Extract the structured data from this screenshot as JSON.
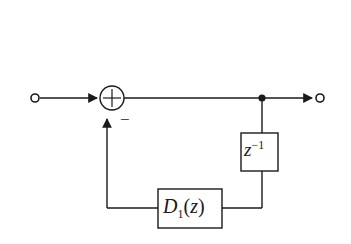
{
  "figure": {
    "type": "block-diagram",
    "background_color": "#ffffff",
    "line_color": "#1a1a1a",
    "canvas": {
      "width": 351,
      "height": 244
    }
  },
  "labels": {
    "delay_base": "z",
    "delay_exponent": "−1",
    "filter_base": "D",
    "filter_subscript": "1",
    "filter_open_paren": "(",
    "filter_arg": "z",
    "filter_close_paren": ")",
    "sum_minus_sign": "−",
    "sum_plus_sign": "+"
  },
  "nodes": [
    {
      "name": "input-terminal",
      "kind": "open-circle",
      "x": 35,
      "y": 98,
      "radius": 4
    },
    {
      "name": "summing-junction",
      "kind": "circle-plus",
      "x": 112,
      "y": 98,
      "radius": 12,
      "signs": [
        "+",
        "−"
      ]
    },
    {
      "name": "branch-node",
      "kind": "filled-dot",
      "x": 262,
      "y": 98,
      "radius": 4
    },
    {
      "name": "output-terminal",
      "kind": "open-circle",
      "x": 320,
      "y": 98,
      "radius": 4
    }
  ],
  "blocks": [
    {
      "name": "delay-block",
      "label": "z^-1",
      "x": 241,
      "y": 133,
      "width": 37,
      "height": 38
    },
    {
      "name": "filter-block",
      "label": "D_1(z)",
      "x": 158,
      "y": 189,
      "width": 64,
      "height": 39
    }
  ],
  "edges": [
    {
      "name": "input-to-sum",
      "from": "input-terminal",
      "to": "summing-junction",
      "arrow": true
    },
    {
      "name": "sum-to-branch",
      "from": "summing-junction",
      "to": "branch-node",
      "arrow": false
    },
    {
      "name": "branch-to-output",
      "from": "branch-node",
      "to": "output-terminal",
      "arrow": true
    },
    {
      "name": "branch-to-delay",
      "from": "branch-node",
      "to": "delay-block",
      "arrow": false
    },
    {
      "name": "delay-to-filter",
      "from": "delay-block",
      "to": "filter-block",
      "arrow": false
    },
    {
      "name": "filter-to-sum",
      "from": "filter-block",
      "to": "summing-junction",
      "arrow": true
    }
  ]
}
